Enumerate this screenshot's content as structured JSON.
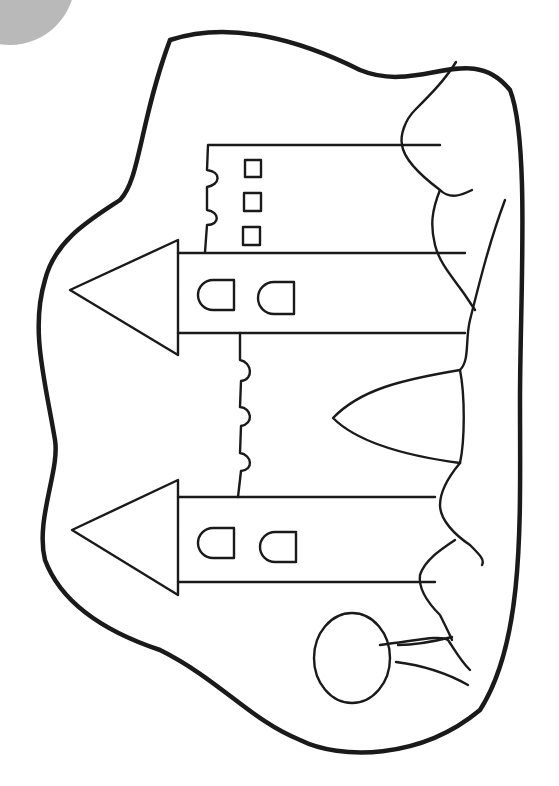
{
  "image": {
    "width": 559,
    "height": 786,
    "subject": "coloring-page castle drawing (rotated 90°)",
    "colors": {
      "background": "#ffffff",
      "ink": "#1a1a1a",
      "corner_shape": "#b9b9b9"
    }
  },
  "corner_shape": {
    "cx": 10,
    "cy": -20,
    "rx": 65,
    "ry": 65
  },
  "outline": {
    "d": "M 170 40 C 230 20, 300 40, 360 70 C 420 95, 470 40, 510 90 C 530 140, 520 300, 520 400 C 520 520, 525 640, 480 710 C 420 760, 340 760, 300 740 C 250 720, 220 680, 160 650 C 100 630, 60 600, 45 560 C 35 520, 60 470, 55 440 C 45 380, 30 330, 45 280 C 55 240, 90 220, 120 200 C 140 180, 140 120, 170 40 Z"
  },
  "towers": [
    {
      "name": "upper-tower",
      "body": {
        "x1": 178,
        "y1": 253,
        "x2": 465,
        "y2": 333
      },
      "roof": {
        "points": "70,290 178,240 178,355"
      },
      "windows": [
        {
          "x": 198,
          "y": 280,
          "w": 36,
          "h": 30
        },
        {
          "x": 258,
          "y": 282,
          "w": 36,
          "h": 32
        }
      ]
    },
    {
      "name": "lower-tower",
      "body": {
        "x1": 178,
        "y1": 497,
        "x2": 435,
        "y2": 582
      },
      "roof": {
        "points": "72,530 178,480 178,595"
      },
      "windows": [
        {
          "x": 198,
          "y": 528,
          "w": 36,
          "h": 30
        },
        {
          "x": 260,
          "y": 532,
          "w": 36,
          "h": 30
        }
      ]
    }
  ],
  "keep": {
    "name": "rear-wall-top",
    "d": "M 440 145 L 208 145 L 207 170 C 222 172, 220 185, 207 187 L 207 210 C 220 212, 220 225, 207 225 L 205 252",
    "square_windows": [
      {
        "x": 245,
        "y": 160,
        "w": 16,
        "h": 17
      },
      {
        "x": 244,
        "y": 193,
        "w": 17,
        "h": 18
      },
      {
        "x": 243,
        "y": 227,
        "w": 17,
        "h": 18
      }
    ]
  },
  "center_wall": {
    "d": "M 240 333 L 240 360 C 252 362, 254 380, 241 381 L 240 407 C 252 408, 254 424, 241 426 L 240 453 C 252 455, 254 470, 241 471 L 238 497",
    "gate": {
      "d": "M 460 370 C 400 380, 360 390, 333 418 C 355 440, 400 455, 460 463 C 465 440, 465 395, 460 370 Z"
    }
  },
  "bushes": [
    {
      "d": "M 456 62 C 445 80, 430 95, 415 110 C 405 120, 400 135, 402 145 C 404 160, 420 175, 440 190 C 450 200, 462 195, 472 190"
    },
    {
      "d": "M 440 190 C 432 210, 430 225, 435 245 C 440 265, 455 280, 465 295 L 475 310"
    },
    {
      "d": "M 505 200 C 490 240, 480 280, 470 320 C 465 340, 470 360, 460 370"
    },
    {
      "d": "M 460 463 C 450 475, 440 490, 440 505 C 440 520, 455 535, 470 545 C 480 555, 485 560, 482 565"
    },
    {
      "d": "M 455 540 C 440 550, 425 560, 420 575 C 418 590, 430 605, 440 615 C 445 625, 450 635, 452 640"
    },
    {
      "d": "M 380 645 C 420 640, 440 635, 448 640 C 455 650, 460 660, 470 670"
    }
  ],
  "tree": {
    "crown": {
      "cx": 352,
      "cy": 658,
      "rx": 38,
      "ry": 45
    },
    "trunk_lines": [
      {
        "d": "M 398 645 C 420 645, 440 640, 452 637"
      },
      {
        "d": "M 396 662 C 420 665, 445 672, 468 685"
      }
    ]
  }
}
